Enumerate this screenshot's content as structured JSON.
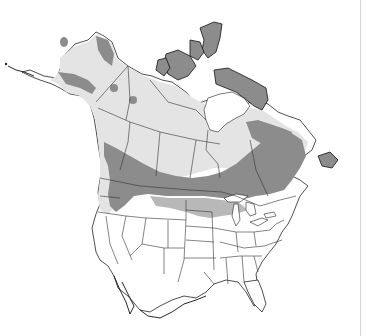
{
  "map": {
    "title": "",
    "region": "North America (Canada, Alaska, contiguous United States)",
    "colors": {
      "background": "#ffffff",
      "land_outside_range": "#ffffff",
      "light_range": "#e4e4e4",
      "dark_range": "#8c8c8c",
      "borders": "#333333"
    },
    "legend": [],
    "zones": [
      {
        "name": "light-range",
        "description": "Light gray shading covering Alaska, Yukon, NWT, northern prairies and Quebec/Labrador boreal region"
      },
      {
        "name": "dark-range",
        "description": "Dark gray shading across Arctic archipelago, northern Quebec, and a band across southern Canada / northern US from Pacific Northwest to the Maritimes"
      }
    ]
  }
}
